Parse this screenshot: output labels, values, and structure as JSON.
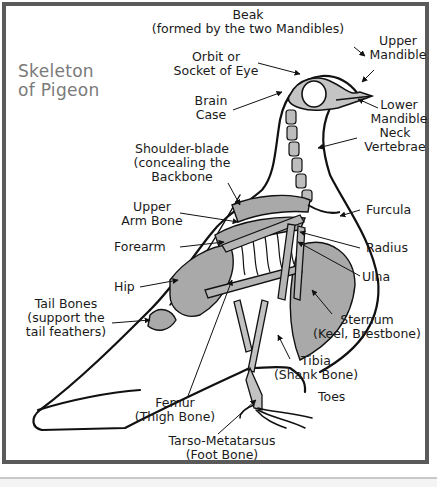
{
  "diagram": {
    "title_line1": "Skeleton",
    "title_line2": "of Pigeon",
    "colors": {
      "frame": "#5a5a5a",
      "bone_fill": "#a9a9a9",
      "outline": "#111111",
      "title": "#7a7a7a",
      "label": "#1a1a1a"
    },
    "labels": {
      "beak": {
        "line1": "Beak",
        "line2": "(formed by the two Mandibles)"
      },
      "upper_mandible": {
        "line1": "Upper",
        "line2": "Mandible"
      },
      "orbit": {
        "line1": "Orbit or",
        "line2": "Socket of Eye"
      },
      "brain_case": {
        "line1": "Brain",
        "line2": "Case"
      },
      "lower_mandible": {
        "line1": "Lower",
        "line2": "Mandible"
      },
      "neck_vertebrae": {
        "line1": "Neck",
        "line2": "Vertebrae"
      },
      "shoulder_blade": {
        "line1": "Shoulder-blade",
        "line2": "(concealing the",
        "line3": "Backbone"
      },
      "upper_arm_bone": {
        "line1": "Upper",
        "line2": "Arm Bone"
      },
      "furcula": {
        "line1": "Furcula"
      },
      "forearm": {
        "line1": "Forearm"
      },
      "radius": {
        "line1": "Radius"
      },
      "ulna": {
        "line1": "Ulna"
      },
      "hip": {
        "line1": "Hip"
      },
      "tail_bones": {
        "line1": "Tail Bones",
        "line2": "(support the",
        "line3": "tail feathers)"
      },
      "sternum": {
        "line1": "Sternum",
        "line2": "(Keel, Brestbone)"
      },
      "tibia": {
        "line1": "Tibia",
        "line2": "(Shank Bone)"
      },
      "toes": {
        "line1": "Toes"
      },
      "femur": {
        "line1": "Femur",
        "line2": "(Thigh Bone)"
      },
      "tarso_metatarsus": {
        "line1": "Tarso-Metatarsus",
        "line2": "(Foot Bone)"
      }
    }
  }
}
